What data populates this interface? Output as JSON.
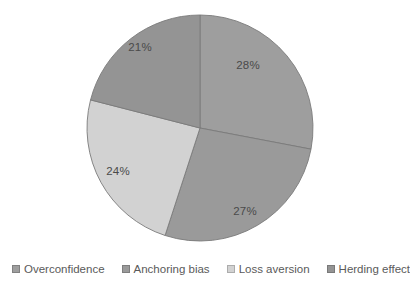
{
  "chart_data": {
    "type": "pie",
    "title": "",
    "categories": [
      "Overconfidence",
      "Anchoring bias",
      "Loss aversion",
      "Herding effect"
    ],
    "values": [
      28,
      27,
      24,
      21
    ],
    "data_labels": [
      "28%",
      "27%",
      "24%",
      "21%"
    ],
    "units": "percent",
    "total": 100,
    "start_angle_deg": 0,
    "direction": "clockwise",
    "legend_position": "bottom",
    "grid": false,
    "colors": [
      "#9e9e9e",
      "#9a9a9a",
      "#d2d2d2",
      "#949494"
    ],
    "background_color": "#ffffff",
    "slice_border_color": "#7a7a7a",
    "label_color": "#4a4a4a"
  },
  "pie": {
    "center_x": 200,
    "center_y": 128,
    "radius": 113,
    "slices": [
      {
        "name": "Overconfidence",
        "label": "28%",
        "value": 28,
        "color": "#9e9e9e",
        "label_x": 248,
        "label_y": 66
      },
      {
        "name": "Anchoring bias",
        "label": "27%",
        "value": 27,
        "color": "#9a9a9a",
        "label_x": 245,
        "label_y": 212
      },
      {
        "name": "Loss aversion",
        "label": "24%",
        "value": 24,
        "color": "#d2d2d2",
        "label_x": 118,
        "label_y": 172
      },
      {
        "name": "Herding effect",
        "label": "21%",
        "value": 21,
        "color": "#949494",
        "label_x": 140,
        "label_y": 48
      }
    ]
  },
  "legend": {
    "items": [
      {
        "label": "Overconfidence",
        "color": "#9e9e9e"
      },
      {
        "label": "Anchoring bias",
        "color": "#9a9a9a"
      },
      {
        "label": "Loss aversion",
        "color": "#d2d2d2"
      },
      {
        "label": "Herding effect",
        "color": "#949494"
      }
    ]
  }
}
